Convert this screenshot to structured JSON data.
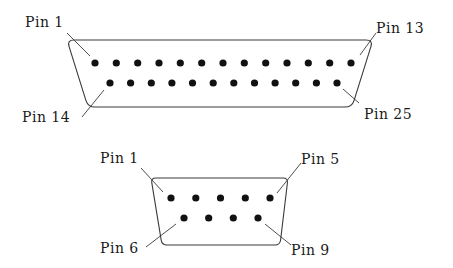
{
  "diagram": {
    "title": "",
    "connectors": [
      {
        "id": "db25",
        "name": "25-pin D-sub connector",
        "shell": {
          "top_left": [
            67,
            40
          ],
          "top_right": [
            373,
            40
          ],
          "bottom_right": [
            352,
            107
          ],
          "bottom_left": [
            88,
            107
          ],
          "corner_radius": 7
        },
        "rows": [
          {
            "y": 63,
            "x_start": 95,
            "x_end": 351,
            "count": 13,
            "first_pin": 1
          },
          {
            "y": 83,
            "x_start": 110,
            "x_end": 337,
            "count": 12,
            "first_pin": 14
          }
        ],
        "pin_radius": 3.6,
        "labels": [
          {
            "text": "Pin 1",
            "x": 25,
            "y": 15,
            "leader": [
              [
                67,
                33
              ],
              [
                90,
                56
              ]
            ]
          },
          {
            "text": "Pin 13",
            "x": 376,
            "y": 21,
            "leader": [
              [
                376,
                33
              ],
              [
                360,
                55
              ]
            ]
          },
          {
            "text": "Pin 14",
            "x": 22,
            "y": 110,
            "leader": [
              [
                82,
                117
              ],
              [
                104,
                90
              ]
            ]
          },
          {
            "text": "Pin 25",
            "x": 364,
            "y": 107,
            "leader": [
              [
                359,
                103
              ],
              [
                343,
                89
              ]
            ]
          }
        ]
      },
      {
        "id": "db9",
        "name": "9-pin D-sub connector",
        "shell": {
          "top_left": [
            151,
            178
          ],
          "top_right": [
            288,
            178
          ],
          "bottom_right": [
            280,
            245
          ],
          "bottom_left": [
            162,
            245
          ],
          "corner_radius": 5
        },
        "rows": [
          {
            "y": 198,
            "x_start": 171,
            "x_end": 270,
            "count": 5,
            "first_pin": 1
          },
          {
            "y": 218,
            "x_start": 184,
            "x_end": 258,
            "count": 4,
            "first_pin": 6
          }
        ],
        "pin_radius": 3.6,
        "labels": [
          {
            "text": "Pin 1",
            "x": 100,
            "y": 151,
            "leader": [
              [
                141,
                168
              ],
              [
                163,
                192
              ]
            ]
          },
          {
            "text": "Pin 5",
            "x": 301,
            "y": 152,
            "leader": [
              [
                301,
                163
              ],
              [
                277,
                193
              ]
            ]
          },
          {
            "text": "Pin 6",
            "x": 100,
            "y": 241,
            "leader": [
              [
                146,
                247
              ],
              [
                176,
                224
              ]
            ]
          },
          {
            "text": "Pin 9",
            "x": 291,
            "y": 243,
            "leader": [
              [
                291,
                245
              ],
              [
                265,
                224
              ]
            ]
          }
        ]
      }
    ]
  }
}
